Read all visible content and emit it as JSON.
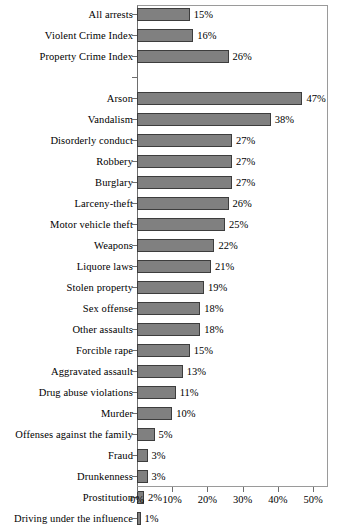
{
  "chart_data": {
    "type": "bar",
    "orientation": "horizontal",
    "title": "",
    "subtitle": "",
    "xlabel": "",
    "ylabel": "",
    "xlim": [
      0,
      55
    ],
    "xticks": [
      0,
      10,
      20,
      30,
      40,
      50
    ],
    "xtick_labels": [
      "0%",
      "10%",
      "20%",
      "30%",
      "40%",
      "50%"
    ],
    "grid": false,
    "legend": null,
    "value_suffix": "%",
    "bar_color": "#808080",
    "bar_border_color": "#3d3d3d",
    "frame_color": "#9a9a9a",
    "categories": [
      "All arrests",
      "Violent Crime Index",
      "Property Crime Index",
      "",
      "Arson",
      "Vandalism",
      "Disorderly conduct",
      "Robbery",
      "Burglary",
      "Larceny-theft",
      "Motor vehicle theft",
      "Weapons",
      "Liquore laws",
      "Stolen property",
      "Sex offense",
      "Other assaults",
      "Forcible rape",
      "Aggravated assault",
      "Drug abuse violations",
      "Murder",
      "Offenses against the family",
      "Fraud",
      "Drunkenness",
      "Prostitution",
      "Driving under the influence"
    ],
    "values": [
      15,
      16,
      26,
      null,
      47,
      38,
      27,
      27,
      27,
      26,
      25,
      22,
      21,
      19,
      18,
      18,
      15,
      13,
      11,
      10,
      5,
      3,
      3,
      2,
      1
    ],
    "value_labels": [
      "15%",
      "16%",
      "26%",
      "",
      "47%",
      "38%",
      "27%",
      "27%",
      "27%",
      "26%",
      "25%",
      "22%",
      "21%",
      "19%",
      "18%",
      "18%",
      "15%",
      "13%",
      "11%",
      "10%",
      "5%",
      "3%",
      "3%",
      "2%",
      "1%"
    ]
  }
}
